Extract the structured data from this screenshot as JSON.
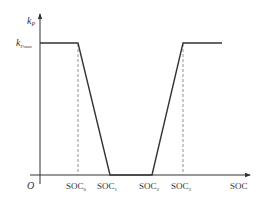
{
  "diagram": {
    "type": "piecewise-linear",
    "y_axis": {
      "label": "k",
      "label_sub": "P",
      "level_label": "k",
      "level_sub": "Pmax"
    },
    "x_axis": {
      "label": "SOC",
      "origin": "O"
    },
    "ticks": [
      {
        "main": "SOC",
        "sub": "0"
      },
      {
        "main": "SOC",
        "sub": "1"
      },
      {
        "main": "SOC",
        "sub": "2"
      },
      {
        "main": "SOC",
        "sub": "3"
      }
    ],
    "curve": {
      "description": "k_P equals k_Pmax below SOC0, drops linearly to 0 at SOC1, stays 0 until SOC2, rises linearly to k_Pmax at SOC3, then constant",
      "points": [
        [
          "0",
          "k_Pmax"
        ],
        [
          "SOC0",
          "k_Pmax"
        ],
        [
          "SOC1",
          "0"
        ],
        [
          "SOC2",
          "0"
        ],
        [
          "SOC3",
          "k_Pmax"
        ],
        [
          "end",
          "k_Pmax"
        ]
      ]
    },
    "colors": {
      "line": "#333333",
      "dashed": "#777777",
      "text": "#333333"
    }
  }
}
